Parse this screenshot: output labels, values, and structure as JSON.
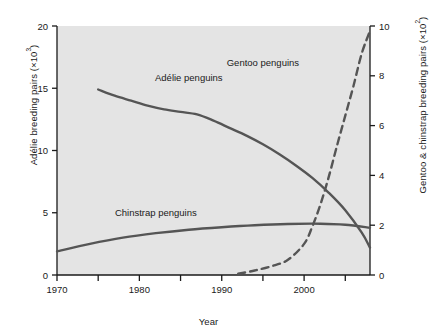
{
  "chart_data": {
    "type": "line",
    "title": "",
    "xlabel": "Year",
    "ylabel_left": "Adélie breeding pairs (×10³)",
    "ylabel_right": "Gentoo & chinstrap breeding pairs (×10²)",
    "xlim": [
      1970,
      2008
    ],
    "ylim_left": [
      0,
      20
    ],
    "ylim_right": [
      0,
      10
    ],
    "xticks": [
      1970,
      1980,
      1990,
      2000
    ],
    "xticks_labels": [
      "1970",
      "1980",
      "1990",
      "2000"
    ],
    "xminorticks": [
      1975,
      1985,
      1995,
      2005
    ],
    "yticks_left": [
      0,
      5,
      10,
      15,
      20
    ],
    "yticks_left_labels": [
      "0",
      "5",
      "10",
      "15",
      "20"
    ],
    "yticks_right": [
      0,
      2,
      4,
      6,
      8,
      10
    ],
    "yticks_right_labels": [
      "0",
      "2",
      "4",
      "6",
      "8",
      "10"
    ],
    "grid": false,
    "legend_position": "inline-annotations",
    "plot_background": "#e4e4e4",
    "line_color": "#555555",
    "series": [
      {
        "name": "Adélie penguins",
        "axis": "left",
        "style": "solid",
        "label_x": 1986,
        "label_y": 15.6,
        "x": [
          1975,
          1977,
          1979,
          1981,
          1983,
          1985,
          1987,
          1989,
          1991,
          1993,
          1995,
          1997,
          1999,
          2001,
          2003,
          2005,
          2007,
          2008
        ],
        "y": [
          14.9,
          14.4,
          14.0,
          13.6,
          13.3,
          13.1,
          12.9,
          12.4,
          11.8,
          11.2,
          10.5,
          9.7,
          8.8,
          7.8,
          6.6,
          5.2,
          3.4,
          2.2
        ]
      },
      {
        "name": "Chinstrap penguins",
        "axis": "right",
        "style": "solid",
        "label_x": 1982,
        "label_y_right": 2.35,
        "x": [
          1970,
          1974,
          1978,
          1982,
          1986,
          1990,
          1994,
          1998,
          2002,
          2005,
          2008
        ],
        "y_right": [
          0.95,
          1.25,
          1.5,
          1.68,
          1.82,
          1.92,
          2.0,
          2.05,
          2.06,
          2.02,
          1.9
        ]
      },
      {
        "name": "Gentoo penguins",
        "axis": "right",
        "style": "dashed",
        "label_x": 1995,
        "label_y_right": 8.4,
        "x": [
          1992,
          1994,
          1996,
          1998,
          2000,
          2001,
          2002,
          2003,
          2004,
          2005,
          2006,
          2007,
          2008
        ],
        "y_right": [
          0.05,
          0.18,
          0.35,
          0.6,
          1.25,
          1.95,
          2.85,
          3.95,
          5.2,
          6.4,
          7.6,
          8.9,
          9.8
        ]
      }
    ],
    "annotations": [
      {
        "text": "Adélie penguins",
        "x": 1986,
        "y": 15.6,
        "axis": "left"
      },
      {
        "text": "Gentoo penguins",
        "x": 1995,
        "y": 8.4,
        "axis": "right"
      },
      {
        "text": "Chinstrap penguins",
        "x": 1982,
        "y": 2.35,
        "axis": "right"
      }
    ]
  },
  "labels": {
    "xlabel": "Year",
    "ylabel_left_main": "Adélie breeding pairs (×10",
    "ylabel_left_sup": "3",
    "ylabel_left_tail": ")",
    "ylabel_right_main": "Gentoo & chinstrap breeding pairs (×10",
    "ylabel_right_sup": "2",
    "ylabel_right_tail": ")",
    "adelie": "Adélie penguins",
    "gentoo": "Gentoo penguins",
    "chinstrap": "Chinstrap penguins"
  }
}
